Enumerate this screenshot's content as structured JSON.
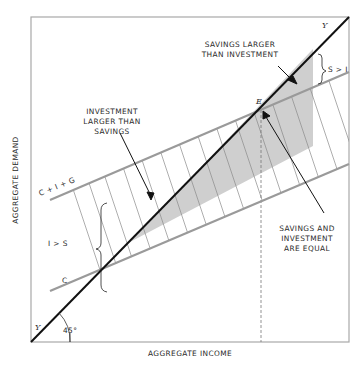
{
  "diagram": {
    "title": "",
    "axes": {
      "x_label": "AGGREGATE INCOME",
      "y_label": "AGGREGATE DEMAND"
    },
    "lines": {
      "forty_five": {
        "label_top": "Y",
        "label_bottom": "Y",
        "angle_label": "45°"
      },
      "cig": {
        "label": "C + I + G"
      },
      "c": {
        "label": "C"
      }
    },
    "point_e": {
      "label": "E"
    },
    "annotations": {
      "investment_larger": [
        "INVESTMENT",
        "LARGER THAN",
        "SAVINGS"
      ],
      "savings_larger": [
        "SAVINGS LARGER",
        "THAN INVESTMENT"
      ],
      "equal": [
        "SAVINGS AND",
        "INVESTMENT",
        "ARE EQUAL"
      ],
      "i_gt_s": "I > S",
      "s_gt_i": "S > I"
    },
    "colors": {
      "line_45": "#111111",
      "schedule_lines": "#9a9a9a",
      "shade": "#cfcfcf",
      "hatch": "#8a8a8a",
      "frame": "#a8a8a8"
    }
  }
}
